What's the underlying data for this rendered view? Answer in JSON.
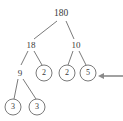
{
  "figure": {
    "type": "factor-tree",
    "background_color": "#ffffff",
    "stroke_color": "#6b6b6b",
    "text_color": "#3a3a3a",
    "width": 123,
    "height": 121
  },
  "nodes": [
    {
      "id": "n180",
      "label": "180",
      "x": 61,
      "y": 14,
      "circled": false,
      "level": 0
    },
    {
      "id": "n18",
      "label": "18",
      "x": 31,
      "y": 45,
      "circled": false,
      "level": 1
    },
    {
      "id": "n10",
      "label": "10",
      "x": 76,
      "y": 45,
      "circled": false,
      "level": 1
    },
    {
      "id": "n9",
      "label": "9",
      "x": 20,
      "y": 73,
      "circled": false,
      "level": 2
    },
    {
      "id": "n2a",
      "label": "2",
      "x": 44,
      "y": 73,
      "circled": true,
      "level": 2
    },
    {
      "id": "n2b",
      "label": "2",
      "x": 67,
      "y": 73,
      "circled": true,
      "level": 2
    },
    {
      "id": "n5",
      "label": "5",
      "x": 88,
      "y": 73,
      "circled": true,
      "level": 2
    },
    {
      "id": "n3a",
      "label": "3",
      "x": 13,
      "y": 107,
      "circled": true,
      "level": 3
    },
    {
      "id": "n3b",
      "label": "3",
      "x": 37,
      "y": 107,
      "circled": true,
      "level": 3
    }
  ],
  "edges": [
    {
      "from": "n180",
      "to": "n18"
    },
    {
      "from": "n180",
      "to": "n10"
    },
    {
      "from": "n18",
      "to": "n9"
    },
    {
      "from": "n18",
      "to": "n2a"
    },
    {
      "from": "n10",
      "to": "n2b"
    },
    {
      "from": "n10",
      "to": "n5"
    },
    {
      "from": "n9",
      "to": "n3a"
    },
    {
      "from": "n9",
      "to": "n3b"
    }
  ],
  "annotation_arrow": {
    "description": "arrow pointing left to the circled 5 node",
    "tail_x": 123,
    "tail_y": 76,
    "head_x": 98,
    "head_y": 76,
    "color": "#8a8a8a"
  },
  "circle_radius": 8
}
